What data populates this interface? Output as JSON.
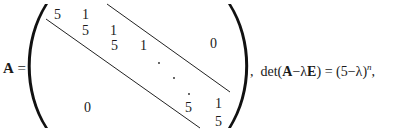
{
  "equation": {
    "lhs_symbol": "A",
    "equals": "=",
    "matrix": {
      "diagonal_value": "5",
      "superdiagonal_value": "1",
      "entries": [
        {
          "id": "r1c1",
          "text": "5",
          "x": 54,
          "y": 8
        },
        {
          "id": "r1c2",
          "text": "1",
          "x": 82,
          "y": 8
        },
        {
          "id": "r2c2",
          "text": "5",
          "x": 82,
          "y": 24
        },
        {
          "id": "r2c3",
          "text": "1",
          "x": 110,
          "y": 24
        },
        {
          "id": "r3c3",
          "text": "5",
          "x": 111,
          "y": 39
        },
        {
          "id": "r3c4",
          "text": "1",
          "x": 140,
          "y": 39
        },
        {
          "id": "rn1cn1",
          "text": "5",
          "x": 185,
          "y": 101
        },
        {
          "id": "rn1cn",
          "text": "1",
          "x": 215,
          "y": 97
        },
        {
          "id": "rncn",
          "text": "5",
          "x": 215,
          "y": 115
        }
      ],
      "upper_zero": "0",
      "lower_zero": "0",
      "ellipsis_dots": "·"
    },
    "rhs": {
      "separator": ",",
      "det": "det",
      "open_paren": "(",
      "A": "A",
      "minus1": "−",
      "lambda1": "λ",
      "E": "E",
      "close_paren": ")",
      "equals": "=",
      "result_open": "(5",
      "minus2": "−",
      "lambda2": "λ",
      "result_close": ")",
      "exponent": "n",
      "trailing": ","
    }
  }
}
